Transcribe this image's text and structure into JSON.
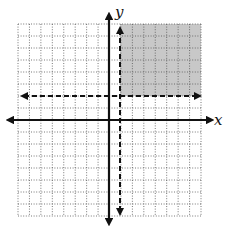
{
  "diagram": {
    "type": "coordinate-plane-inequality-graph",
    "axes": {
      "x_label": "x",
      "y_label": "y"
    },
    "grid": {
      "x_min": -8,
      "x_max": 8,
      "y_min": -8,
      "y_max": 8,
      "style": "dotted"
    },
    "boundary_lines": [
      {
        "orientation": "vertical",
        "value": 1,
        "style": "dashed"
      },
      {
        "orientation": "horizontal",
        "value": 2,
        "style": "dashed"
      }
    ],
    "shaded_region": {
      "x_from": 1,
      "x_to": 8,
      "y_from": 2,
      "y_to": 8
    },
    "colors": {
      "shade": "#c8c8c8",
      "grid": "#555555",
      "axis": "#111111"
    }
  }
}
